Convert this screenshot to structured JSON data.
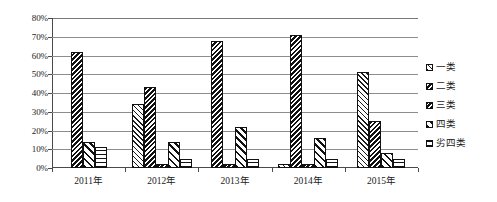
{
  "chart_data": {
    "type": "bar",
    "title": "",
    "subtitle": "",
    "xlabel": "",
    "ylabel": "",
    "categories": [
      "2011年",
      "2012年",
      "2013年",
      "2014年",
      "2015年"
    ],
    "ylim": [
      0,
      80
    ],
    "ytick_labels": [
      "80%",
      "70%",
      "60%",
      "50%",
      "40%",
      "30%",
      "20%",
      "10%",
      "0%"
    ],
    "ytick_values": [
      80,
      70,
      60,
      50,
      40,
      30,
      20,
      10,
      0
    ],
    "grid": true,
    "legend_position": "right",
    "series": [
      {
        "name": "一类",
        "pattern": "light-forward-diagonal",
        "values": [
          0,
          34,
          0,
          2,
          51
        ]
      },
      {
        "name": "二类",
        "pattern": "dense-back-diagonal",
        "values": [
          62,
          43,
          68,
          71,
          25
        ]
      },
      {
        "name": "三类",
        "pattern": "solid-back-diagonal",
        "values": [
          0,
          2,
          2,
          2,
          0
        ]
      },
      {
        "name": "四类",
        "pattern": "wide-forward-diagonal",
        "values": [
          14,
          14,
          22,
          16,
          8
        ]
      },
      {
        "name": "劣四类",
        "pattern": "grid",
        "values": [
          11,
          5,
          5,
          5,
          5
        ]
      }
    ]
  },
  "legend": {
    "items": [
      {
        "label": "一类"
      },
      {
        "label": "二类"
      },
      {
        "label": "三类"
      },
      {
        "label": "四类"
      },
      {
        "label": "劣四类"
      }
    ]
  }
}
